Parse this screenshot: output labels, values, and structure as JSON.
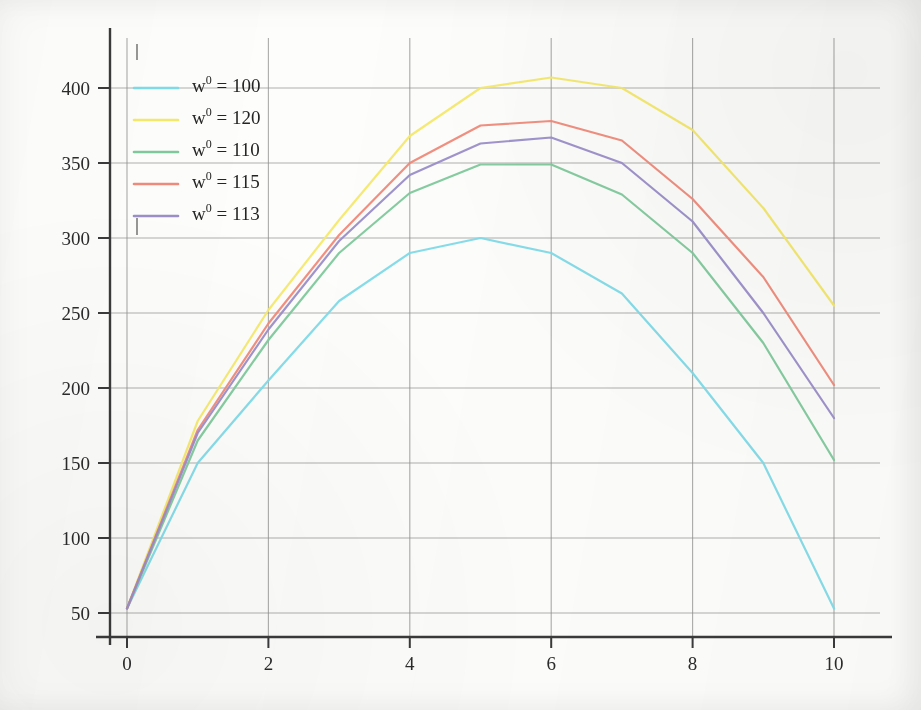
{
  "chart_data": {
    "type": "line",
    "title": "",
    "xlabel": "",
    "ylabel": "",
    "xlim": [
      0,
      10
    ],
    "ylim": [
      40,
      420
    ],
    "grid": true,
    "legend_position": "top-left",
    "x_ticks": [
      "0",
      "2",
      "4",
      "6",
      "8",
      "10"
    ],
    "x_tick_values": [
      0,
      2,
      4,
      6,
      8,
      10
    ],
    "y_ticks": [
      "50",
      "100",
      "150",
      "200",
      "250",
      "300",
      "350",
      "400"
    ],
    "y_tick_values": [
      50,
      100,
      150,
      200,
      250,
      300,
      350,
      400
    ],
    "x": [
      0,
      1,
      2,
      3,
      4,
      5,
      6,
      7,
      8,
      9,
      10
    ],
    "series": [
      {
        "name": "w0 = 100",
        "legend_label_base": "w",
        "legend_label_sup": "0",
        "legend_label_rest": " = 100",
        "color": "#7fdbe8",
        "values": [
          53,
          150,
          205,
          258,
          290,
          300,
          290,
          263,
          210,
          150,
          53
        ]
      },
      {
        "name": "w0 = 120",
        "legend_label_base": "w",
        "legend_label_sup": "0",
        "legend_label_rest": " = 120",
        "color": "#f5e96b",
        "values": [
          53,
          178,
          252,
          312,
          368,
          400,
          407,
          400,
          372,
          320,
          255
        ]
      },
      {
        "name": "w0 = 110",
        "legend_label_base": "w",
        "legend_label_sup": "0",
        "legend_label_rest": " = 110",
        "color": "#7fc99c",
        "values": [
          53,
          165,
          232,
          290,
          330,
          349,
          349,
          329,
          290,
          230,
          152
        ]
      },
      {
        "name": "w0 = 115",
        "legend_label_base": "w",
        "legend_label_sup": "0",
        "legend_label_rest": " = 115",
        "color": "#f08a7a",
        "values": [
          53,
          172,
          243,
          302,
          350,
          375,
          378,
          365,
          326,
          274,
          202
        ]
      },
      {
        "name": "w0 = 113",
        "legend_label_base": "w",
        "legend_label_sup": "0",
        "legend_label_rest": " = 113",
        "color": "#9b8ec9",
        "values": [
          53,
          170,
          239,
          298,
          342,
          363,
          367,
          350,
          311,
          250,
          180
        ]
      }
    ]
  },
  "axes": {
    "axis_color": "#3a3a3a",
    "grid_color": "#8f8f8f"
  }
}
